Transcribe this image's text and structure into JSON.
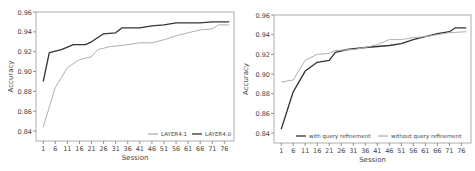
{
  "chart_data": [
    {
      "type": "line",
      "title": "",
      "xlabel": "Session",
      "ylabel": "Accuracy",
      "ylim": [
        0.83,
        0.96
      ],
      "xlim": [
        -2,
        80
      ],
      "xticks": [
        1,
        6,
        11,
        16,
        21,
        26,
        31,
        36,
        41,
        46,
        51,
        56,
        61,
        66,
        71,
        76
      ],
      "yticks": [
        0.84,
        0.86,
        0.88,
        0.9,
        0.92,
        0.94,
        0.96
      ],
      "ytick_labels": [
        "0.84",
        "0.86",
        "0.88",
        "0.90",
        "0.92",
        "0.94",
        "0.96"
      ],
      "legend_position": "lower right",
      "series": [
        {
          "name": "LAYER4.1",
          "color": "#b0b0b0",
          "x": [
            1,
            6,
            11,
            16,
            21,
            23.5,
            28.5,
            36,
            41,
            46,
            51,
            56,
            61,
            66,
            71,
            73.5,
            78
          ],
          "values": [
            0.844,
            0.884,
            0.904,
            0.912,
            0.915,
            0.922,
            0.925,
            0.927,
            0.929,
            0.929,
            0.932,
            0.936,
            0.939,
            0.942,
            0.943,
            0.947,
            0.947
          ]
        },
        {
          "name": "LAYER4.0",
          "color": "#333333",
          "x": [
            1,
            3.5,
            8.5,
            13.5,
            18.5,
            21,
            26,
            31,
            33.5,
            41,
            46,
            51,
            56,
            66,
            71,
            78
          ],
          "values": [
            0.89,
            0.919,
            0.922,
            0.927,
            0.927,
            0.93,
            0.938,
            0.939,
            0.944,
            0.944,
            0.946,
            0.947,
            0.949,
            0.949,
            0.95,
            0.95
          ]
        }
      ]
    },
    {
      "type": "line",
      "title": "",
      "xlabel": "Session",
      "ylabel": "Accuracy",
      "ylim": [
        0.83,
        0.96
      ],
      "xlim": [
        -2,
        80
      ],
      "xticks": [
        1,
        6,
        11,
        16,
        21,
        26,
        31,
        36,
        41,
        46,
        51,
        56,
        61,
        66,
        71,
        76
      ],
      "yticks": [
        0.84,
        0.86,
        0.88,
        0.9,
        0.92,
        0.94,
        0.96
      ],
      "ytick_labels": [
        "0.84",
        "0.86",
        "0.88",
        "0.90",
        "0.92",
        "0.94",
        "0.96"
      ],
      "legend_position": "lower right",
      "series": [
        {
          "name": "with query refinement",
          "color": "#333333",
          "x": [
            1,
            6,
            11,
            16,
            21,
            23.5,
            28.5,
            36,
            41,
            46,
            51,
            56,
            61,
            66,
            71,
            73.5,
            78
          ],
          "values": [
            0.844,
            0.882,
            0.903,
            0.912,
            0.914,
            0.922,
            0.925,
            0.927,
            0.928,
            0.929,
            0.931,
            0.935,
            0.938,
            0.941,
            0.943,
            0.947,
            0.947
          ]
        },
        {
          "name": "without query refinement",
          "color": "#b0b0b0",
          "x": [
            1,
            6,
            11,
            16,
            21,
            23.5,
            31,
            36,
            41,
            46,
            51,
            56,
            61,
            66,
            71,
            78
          ],
          "values": [
            0.892,
            0.894,
            0.914,
            0.92,
            0.921,
            0.924,
            0.925,
            0.927,
            0.93,
            0.935,
            0.935,
            0.937,
            0.938,
            0.94,
            0.942,
            0.943
          ]
        }
      ]
    }
  ]
}
